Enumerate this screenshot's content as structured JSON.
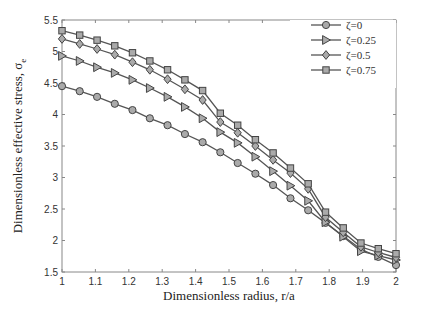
{
  "chart_data": {
    "type": "line",
    "title": "",
    "xlabel": "Dimensionless radius, r/a",
    "ylabel": "Dimensionless effective stress, σ",
    "ylabel_subscript": "e",
    "xlim": [
      1,
      2
    ],
    "ylim": [
      1.5,
      5.5
    ],
    "xticks": [
      1,
      1.1,
      1.2,
      1.3,
      1.4,
      1.5,
      1.6,
      1.7,
      1.8,
      1.9,
      2
    ],
    "xtick_labels": [
      "1",
      "1.1",
      "1.2",
      "1.3",
      "1.4",
      "1.5",
      "1.6",
      "1.7",
      "1.8",
      "1.9",
      "2"
    ],
    "yticks": [
      1.5,
      2,
      2.5,
      3,
      3.5,
      4,
      4.5,
      5,
      5.5
    ],
    "ytick_labels": [
      "1.5",
      "2",
      "2.5",
      "3",
      "3.5",
      "4",
      "4.5",
      "5",
      "5.5"
    ],
    "grid": false,
    "legend_position": "upper right",
    "x": [
      1.0,
      1.053,
      1.105,
      1.158,
      1.211,
      1.263,
      1.316,
      1.368,
      1.421,
      1.474,
      1.526,
      1.579,
      1.632,
      1.684,
      1.737,
      1.789,
      1.842,
      1.895,
      1.947,
      2.0
    ],
    "series": [
      {
        "name": "ζ=0",
        "marker": "circle",
        "values": [
          4.45,
          4.37,
          4.28,
          4.17,
          4.07,
          3.94,
          3.83,
          3.69,
          3.56,
          3.4,
          3.23,
          3.06,
          2.88,
          2.67,
          2.48,
          2.28,
          2.07,
          1.86,
          1.74,
          1.61
        ]
      },
      {
        "name": "ζ=0.25",
        "marker": "triangle-right",
        "values": [
          4.93,
          4.85,
          4.75,
          4.66,
          4.55,
          4.42,
          4.28,
          4.12,
          3.94,
          3.72,
          3.55,
          3.33,
          3.1,
          2.87,
          2.63,
          2.29,
          2.06,
          1.83,
          1.76,
          1.69
        ]
      },
      {
        "name": "ζ=0.5",
        "marker": "diamond",
        "values": [
          5.2,
          5.12,
          5.04,
          4.95,
          4.83,
          4.71,
          4.56,
          4.4,
          4.23,
          3.88,
          3.71,
          3.5,
          3.28,
          3.07,
          2.82,
          2.37,
          2.13,
          1.9,
          1.81,
          1.73
        ]
      },
      {
        "name": "ζ=0.75",
        "marker": "square",
        "values": [
          5.33,
          5.26,
          5.18,
          5.09,
          4.98,
          4.85,
          4.71,
          4.55,
          4.38,
          4.02,
          3.83,
          3.6,
          3.39,
          3.15,
          2.9,
          2.45,
          2.2,
          1.96,
          1.87,
          1.79
        ]
      }
    ],
    "colors": {
      "line": "#555555",
      "marker_fill": "#aaaaaa",
      "marker_stroke": "#444444",
      "axis": "#888888"
    }
  }
}
